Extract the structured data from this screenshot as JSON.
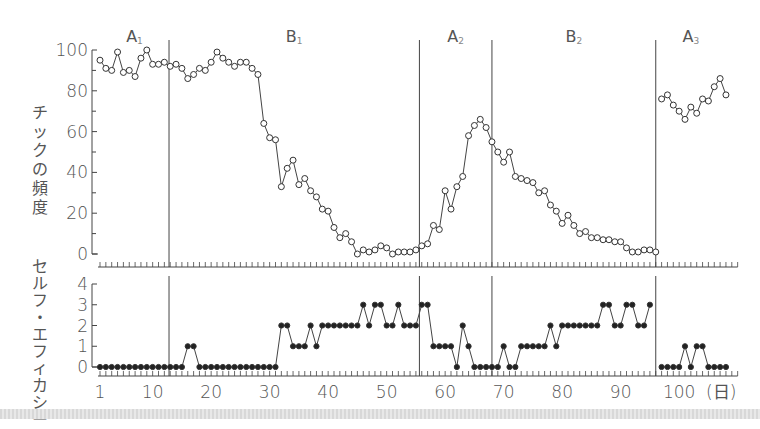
{
  "chart_data": [
    {
      "type": "line",
      "title": "",
      "ylabel": "チックの頻度",
      "xlabel": "(日)",
      "ylim": [
        0,
        100
      ],
      "yticks": [
        0,
        20,
        40,
        60,
        80,
        100
      ],
      "phases": [
        {
          "label": "A",
          "sub": "1",
          "start": 1,
          "end": 12.8
        },
        {
          "label": "B",
          "sub": "1",
          "start": 12.8,
          "end": 55.6
        },
        {
          "label": "A",
          "sub": "2",
          "start": 55.6,
          "end": 68
        },
        {
          "label": "B",
          "sub": "2",
          "start": 68,
          "end": 96
        },
        {
          "label": "A",
          "sub": "3",
          "start": 96,
          "end": 108
        }
      ],
      "phase_lines": [
        12.8,
        55.6,
        68,
        96
      ],
      "series": [
        {
          "name": "チックの頻度",
          "marker": "open-circle",
          "segments": [
            {
              "x_start": 1,
              "values": [
                95,
                91,
                90,
                99,
                89,
                90,
                87,
                96,
                100,
                93,
                93,
                94,
                92,
                93,
                91,
                86,
                88,
                91,
                90,
                94,
                99,
                96,
                94,
                92,
                94,
                94,
                91,
                88,
                64,
                57,
                56,
                33,
                42,
                46,
                34,
                37,
                31,
                28,
                22,
                21,
                13,
                8,
                10,
                6,
                0,
                2,
                1,
                2,
                4,
                3,
                0,
                1,
                1,
                1,
                2,
                4,
                5,
                14,
                12,
                31,
                22,
                33,
                38,
                58,
                63,
                66,
                62,
                55,
                50,
                45,
                50,
                38,
                37,
                36,
                35,
                30,
                31,
                24,
                21,
                15,
                19,
                14,
                10,
                11,
                8,
                8,
                7,
                7,
                6,
                6,
                3,
                1,
                1,
                2,
                2,
                1
              ]
            },
            {
              "x_start": 97,
              "values": [
                76,
                78,
                73,
                70,
                66,
                72,
                69,
                76,
                75,
                82,
                86,
                78
              ]
            }
          ]
        }
      ]
    },
    {
      "type": "line",
      "title": "",
      "ylabel": "セルフ・エフィカシー",
      "xlabel": "(日)",
      "ylim": [
        0,
        4
      ],
      "yticks": [
        0,
        1,
        2,
        3,
        4
      ],
      "xticks": [
        1,
        10,
        20,
        30,
        40,
        50,
        60,
        70,
        80,
        90,
        100
      ],
      "xtick_suffix": "(日)",
      "phase_lines": [
        12.8,
        55.6,
        68,
        96
      ],
      "series": [
        {
          "name": "セルフ・エフィカシー",
          "marker": "filled-circle",
          "segments": [
            {
              "x_start": 1,
              "values": [
                0,
                0,
                0,
                0,
                0,
                0,
                0,
                0,
                0,
                0,
                0,
                0,
                0,
                0,
                0,
                1,
                1,
                0,
                0,
                0,
                0,
                0,
                0,
                0,
                0,
                0,
                0,
                0,
                0,
                0,
                0,
                2,
                2,
                1,
                1,
                1,
                2,
                1,
                2,
                2,
                2,
                2,
                2,
                2,
                2,
                3,
                2,
                3,
                3,
                2,
                2,
                3,
                2,
                2,
                2,
                3,
                3,
                1,
                1,
                1,
                1,
                0,
                2,
                1,
                0,
                0,
                0,
                0,
                0,
                1,
                0,
                0,
                1,
                1,
                1,
                1,
                1,
                2,
                1,
                2,
                2,
                2,
                2,
                2,
                2,
                2,
                3,
                3,
                2,
                2,
                3,
                3,
                2,
                2,
                3
              ]
            },
            {
              "x_start": 97,
              "values": [
                0,
                0,
                0,
                0,
                1,
                0,
                1,
                1,
                0,
                0,
                0,
                0
              ]
            }
          ]
        }
      ]
    }
  ],
  "axis": {
    "top_ylabel_chars": [
      "チ",
      "ッ",
      "ク",
      "の",
      "頻",
      "度"
    ],
    "bottom_ylabel_chars": [
      "セ",
      "ル",
      "フ",
      "・",
      "エ",
      "フ",
      "ィ",
      "カ",
      "シ",
      "ー"
    ],
    "x_unit": "(日)"
  }
}
